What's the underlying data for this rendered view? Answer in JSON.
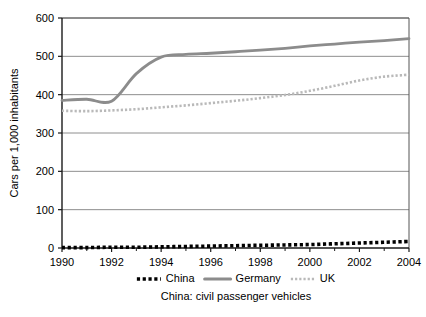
{
  "chart_data": {
    "type": "line",
    "title": "",
    "xlabel": "",
    "ylabel": "Cars per 1,000 inhabitants",
    "caption": "China: civil passenger vehicles",
    "xlim": [
      1990,
      2004
    ],
    "ylim": [
      0,
      600
    ],
    "ytick_step": 100,
    "grid": true,
    "legend_position": "bottom",
    "x": [
      1990,
      1991,
      1992,
      1993,
      1994,
      1995,
      1996,
      1997,
      1998,
      1999,
      2000,
      2001,
      2002,
      2003,
      2004
    ],
    "ytick_labels": [
      "0",
      "100",
      "200",
      "300",
      "400",
      "500",
      "600"
    ],
    "xtick_labels": [
      "1990",
      "1992",
      "1994",
      "1996",
      "1998",
      "2000",
      "2002",
      "2004"
    ],
    "xtick_values": [
      1990,
      1992,
      1994,
      1996,
      1998,
      2000,
      2002,
      2004
    ],
    "xtick_minor_values": [
      1991,
      1993,
      1995,
      1997,
      1999,
      2001,
      2003
    ],
    "series": [
      {
        "name": "China",
        "style": "dotted-square",
        "color": "#000000",
        "values": [
          1,
          1,
          2,
          2,
          3,
          4,
          5,
          6,
          7,
          8,
          9,
          11,
          13,
          15,
          17
        ]
      },
      {
        "name": "Germany",
        "style": "solid-thick",
        "color": "#8c8c8c",
        "values": [
          385,
          388,
          383,
          455,
          498,
          505,
          508,
          512,
          516,
          521,
          527,
          532,
          537,
          541,
          546
        ]
      },
      {
        "name": "UK",
        "style": "dotted-fine",
        "color": "#b9b9b9",
        "values": [
          358,
          357,
          359,
          362,
          367,
          372,
          378,
          384,
          391,
          399,
          410,
          423,
          437,
          447,
          452
        ]
      }
    ]
  },
  "legend": {
    "items": [
      {
        "label": "China"
      },
      {
        "label": "Germany"
      },
      {
        "label": "UK"
      }
    ]
  }
}
